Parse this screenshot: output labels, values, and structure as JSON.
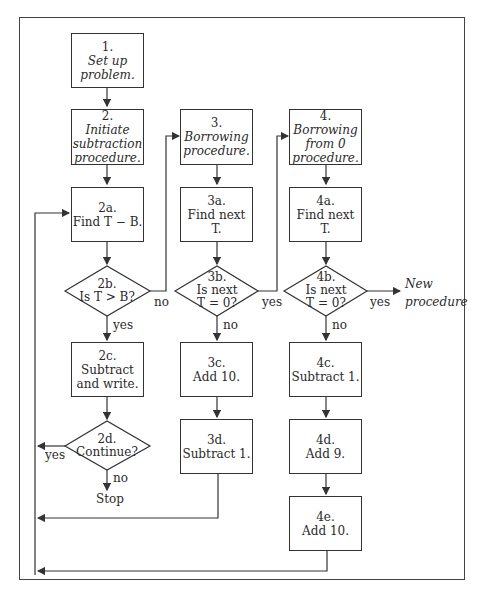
{
  "nodes": {
    "n1": {
      "num": "1.",
      "lines": [
        "Set up",
        "problem."
      ]
    },
    "n2": {
      "num": "2.",
      "lines": [
        "Initiate",
        "subtraction",
        "procedure."
      ]
    },
    "n2a": {
      "num": "2a.",
      "lines": [
        "Find T − B."
      ]
    },
    "n2b": {
      "num": "2b.",
      "lines": [
        "Is T > B?"
      ]
    },
    "n2c": {
      "num": "2c.",
      "lines": [
        "Subtract",
        "and write."
      ]
    },
    "n2d": {
      "num": "2d.",
      "lines": [
        "Continue?"
      ]
    },
    "n3": {
      "num": "3.",
      "lines": [
        "Borrowing",
        "procedure."
      ]
    },
    "n3a": {
      "num": "3a.",
      "lines": [
        "Find next T."
      ]
    },
    "n3b": {
      "num": "3b.",
      "lines": [
        "Is next",
        "T = 0?"
      ]
    },
    "n3c": {
      "num": "3c.",
      "lines": [
        "Add 10."
      ]
    },
    "n3d": {
      "num": "3d.",
      "lines": [
        "Subtract 1."
      ]
    },
    "n4": {
      "num": "4.",
      "lines": [
        "Borrowing",
        "from 0",
        "procedure."
      ]
    },
    "n4a": {
      "num": "4a.",
      "lines": [
        "Find next T."
      ]
    },
    "n4b": {
      "num": "4b.",
      "lines": [
        "Is next",
        "T = 0?"
      ]
    },
    "n4c": {
      "num": "4c.",
      "lines": [
        "Subtract 1."
      ]
    },
    "n4d": {
      "num": "4d.",
      "lines": [
        "Add 9."
      ]
    },
    "n4e": {
      "num": "4e.",
      "lines": [
        "Add 10."
      ]
    }
  },
  "edge_labels": {
    "b2_no": "no",
    "b2_yes": "yes",
    "d2_yes": "yes",
    "d2_no": "no",
    "stop": "Stop",
    "b3_yes": "yes",
    "b3_no": "no",
    "b4_yes": "yes",
    "b4_no": "no",
    "new_procedure": [
      "New",
      "procedure"
    ]
  },
  "colors": {
    "line": "#333333",
    "background": "#ffffff"
  }
}
